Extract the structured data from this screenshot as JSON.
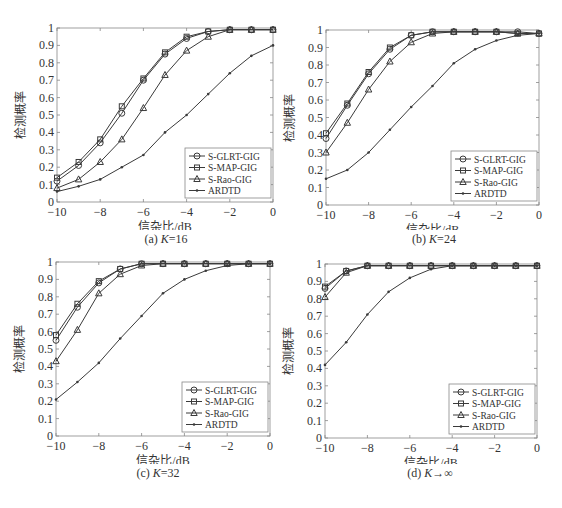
{
  "chart_data": [
    {
      "type": "line",
      "id": "a",
      "caption": "(a) K=16",
      "xlabel": "信杂比/dB",
      "ylabel": "检测概率",
      "xlim": [
        -10,
        0
      ],
      "ylim": [
        0,
        1
      ],
      "xticks": [
        "-10",
        "-8",
        "-6",
        "-4",
        "-2",
        "0"
      ],
      "yticks": [
        "0",
        "0.1",
        "0.2",
        "0.3",
        "0.4",
        "0.5",
        "0.6",
        "0.7",
        "0.8",
        "0.9",
        "1"
      ],
      "legend_position": "lower right",
      "x": [
        -10,
        -9,
        -8,
        -7,
        -6,
        -5,
        -4,
        -3,
        -2,
        -1,
        0
      ],
      "series": [
        {
          "name": "S-GLRT-GIG",
          "marker": "circle",
          "values": [
            0.12,
            0.21,
            0.34,
            0.51,
            0.7,
            0.85,
            0.94,
            0.98,
            0.99,
            0.99,
            0.99
          ]
        },
        {
          "name": "S-MAP-GIG",
          "marker": "square",
          "values": [
            0.14,
            0.23,
            0.36,
            0.55,
            0.71,
            0.86,
            0.95,
            0.98,
            0.99,
            0.99,
            0.99
          ]
        },
        {
          "name": "S-Rao-GIG",
          "marker": "triangle",
          "values": [
            0.08,
            0.13,
            0.23,
            0.36,
            0.54,
            0.73,
            0.87,
            0.95,
            0.99,
            0.99,
            0.99
          ]
        },
        {
          "name": "ARDTD",
          "marker": "star",
          "values": [
            0.06,
            0.09,
            0.13,
            0.2,
            0.27,
            0.4,
            0.5,
            0.62,
            0.74,
            0.84,
            0.9
          ]
        }
      ]
    },
    {
      "type": "line",
      "id": "b",
      "caption": "(b) K=24",
      "xlabel": "信杂比/dB",
      "ylabel": "检测概率",
      "xlim": [
        -10,
        0
      ],
      "ylim": [
        0,
        1
      ],
      "xticks": [
        "-10",
        "-8",
        "-6",
        "-4",
        "-2",
        "0"
      ],
      "yticks": [
        "0",
        "0.1",
        "0.2",
        "0.3",
        "0.4",
        "0.5",
        "0.6",
        "0.7",
        "0.8",
        "0.9",
        "1"
      ],
      "legend_position": "lower right",
      "x": [
        -10,
        -9,
        -8,
        -7,
        -6,
        -5,
        -4,
        -3,
        -2,
        -1,
        0
      ],
      "series": [
        {
          "name": "S-GLRT-GIG",
          "marker": "circle",
          "values": [
            0.38,
            0.57,
            0.75,
            0.89,
            0.97,
            0.99,
            0.99,
            0.99,
            0.99,
            0.99,
            0.98
          ]
        },
        {
          "name": "S-MAP-GIG",
          "marker": "square",
          "values": [
            0.41,
            0.58,
            0.76,
            0.9,
            0.97,
            0.99,
            0.99,
            0.99,
            0.99,
            0.98,
            0.98
          ]
        },
        {
          "name": "S-Rao-GIG",
          "marker": "triangle",
          "values": [
            0.3,
            0.47,
            0.66,
            0.82,
            0.93,
            0.98,
            0.99,
            0.99,
            0.99,
            0.98,
            0.98
          ]
        },
        {
          "name": "ARDTD",
          "marker": "star",
          "values": [
            0.15,
            0.2,
            0.3,
            0.43,
            0.56,
            0.68,
            0.81,
            0.89,
            0.94,
            0.97,
            0.98
          ]
        }
      ]
    },
    {
      "type": "line",
      "id": "c",
      "caption": "(c) K=32",
      "xlabel": "信杂比/dB",
      "ylabel": "检测概率",
      "xlim": [
        -10,
        0
      ],
      "ylim": [
        0,
        1
      ],
      "xticks": [
        "-10",
        "-8",
        "-6",
        "-4",
        "-2",
        "0"
      ],
      "yticks": [
        "0",
        "0.1",
        "0.2",
        "0.3",
        "0.4",
        "0.5",
        "0.6",
        "0.7",
        "0.8",
        "0.9",
        "1"
      ],
      "legend_position": "lower right",
      "x": [
        -10,
        -9,
        -8,
        -7,
        -6,
        -5,
        -4,
        -3,
        -2,
        -1,
        0
      ],
      "series": [
        {
          "name": "S-GLRT-GIG",
          "marker": "circle",
          "values": [
            0.55,
            0.74,
            0.88,
            0.96,
            0.99,
            0.99,
            0.99,
            0.99,
            0.99,
            0.99,
            0.99
          ]
        },
        {
          "name": "S-MAP-GIG",
          "marker": "square",
          "values": [
            0.58,
            0.76,
            0.89,
            0.96,
            0.99,
            0.99,
            0.99,
            0.99,
            0.99,
            0.99,
            0.99
          ]
        },
        {
          "name": "S-Rao-GIG",
          "marker": "triangle",
          "values": [
            0.43,
            0.61,
            0.82,
            0.93,
            0.98,
            0.99,
            0.99,
            0.99,
            0.99,
            0.99,
            0.99
          ]
        },
        {
          "name": "ARDTD",
          "marker": "star",
          "values": [
            0.21,
            0.31,
            0.42,
            0.56,
            0.69,
            0.82,
            0.9,
            0.95,
            0.98,
            0.99,
            0.99
          ]
        }
      ]
    },
    {
      "type": "line",
      "id": "d",
      "caption": "(d) K→∞",
      "xlabel": "信杂比/dB",
      "ylabel": "检测概率",
      "xlim": [
        -10,
        0
      ],
      "ylim": [
        0,
        1
      ],
      "xticks": [
        "-10",
        "-8",
        "-6",
        "-4",
        "-2",
        "0"
      ],
      "yticks": [
        "0",
        "0.1",
        "0.2",
        "0.3",
        "0.4",
        "0.5",
        "0.6",
        "0.7",
        "0.8",
        "0.9",
        "1"
      ],
      "legend_position": "lower right",
      "x": [
        -10,
        -9,
        -8,
        -7,
        -6,
        -5,
        -4,
        -3,
        -2,
        -1,
        0
      ],
      "series": [
        {
          "name": "S-GLRT-GIG",
          "marker": "circle",
          "values": [
            0.86,
            0.96,
            0.99,
            0.99,
            0.99,
            0.99,
            0.99,
            0.99,
            0.99,
            0.99,
            0.99
          ]
        },
        {
          "name": "S-MAP-GIG",
          "marker": "square",
          "values": [
            0.87,
            0.96,
            0.99,
            0.99,
            0.99,
            0.99,
            0.99,
            0.99,
            0.99,
            0.99,
            0.99
          ]
        },
        {
          "name": "S-Rao-GIG",
          "marker": "triangle",
          "values": [
            0.81,
            0.95,
            0.99,
            0.99,
            0.99,
            0.99,
            0.99,
            0.99,
            0.99,
            0.99,
            0.99
          ]
        },
        {
          "name": "ARDTD",
          "marker": "star",
          "values": [
            0.42,
            0.55,
            0.71,
            0.84,
            0.92,
            0.97,
            0.99,
            0.99,
            0.99,
            0.99,
            0.99
          ]
        }
      ]
    }
  ],
  "panels": [
    {
      "caption_prefix": "(a) ",
      "caption_k": "K",
      "caption_suffix": "=16"
    },
    {
      "caption_prefix": "(b) ",
      "caption_k": "K",
      "caption_suffix": "=24"
    },
    {
      "caption_prefix": "(c) ",
      "caption_k": "K",
      "caption_suffix": "=32"
    },
    {
      "caption_prefix": "(d) ",
      "caption_k": "K",
      "caption_suffix": "→∞"
    }
  ],
  "colors": {
    "line": "#3a3a3a",
    "axis": "#555555",
    "text": "#333333"
  }
}
